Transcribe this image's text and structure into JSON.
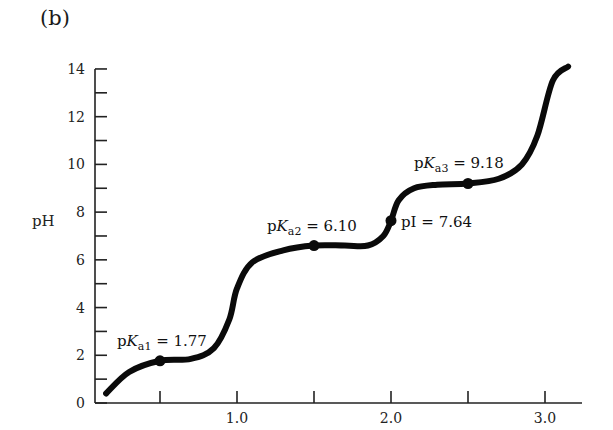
{
  "panel_label": "(b)",
  "chart_data": {
    "type": "line",
    "title": "",
    "xlabel": "",
    "ylabel": "pH",
    "xlim": [
      0.08,
      3.2
    ],
    "ylim": [
      0,
      14
    ],
    "x_ticks": [
      0.5,
      1.0,
      1.5,
      2.0,
      2.5,
      3.0
    ],
    "x_tick_labels": [
      "",
      "1.0",
      "",
      "2.0",
      "",
      "3.0"
    ],
    "y_ticks": [
      0,
      1,
      2,
      3,
      4,
      5,
      6,
      7,
      8,
      9,
      10,
      11,
      12,
      13,
      14
    ],
    "y_tick_labels": [
      "0",
      "",
      "2",
      "",
      "4",
      "",
      "6",
      "",
      "8",
      "",
      "10",
      "",
      "12",
      "",
      "14"
    ],
    "grid": false,
    "series": [
      {
        "name": "titration curve",
        "x": [
          0.15,
          0.3,
          0.5,
          0.7,
          0.85,
          0.95,
          1.0,
          1.1,
          1.3,
          1.5,
          1.7,
          1.85,
          1.95,
          2.0,
          2.05,
          2.15,
          2.3,
          2.5,
          2.7,
          2.85,
          2.95,
          3.05,
          3.15
        ],
        "y": [
          0.4,
          1.3,
          1.77,
          1.85,
          2.3,
          3.5,
          4.8,
          5.9,
          6.4,
          6.6,
          6.6,
          6.6,
          7.0,
          7.64,
          8.5,
          9.0,
          9.15,
          9.2,
          9.4,
          10.0,
          11.2,
          13.5,
          14.1
        ]
      }
    ],
    "annotations": [
      {
        "label": "pKa1 = 1.77",
        "prefix": "p",
        "K": "K",
        "sub": "a1",
        "value": "= 1.77",
        "x": 0.5,
        "y": 1.77
      },
      {
        "label": "pKa2 = 6.10",
        "prefix": "p",
        "K": "K",
        "sub": "a2",
        "value": "= 6.10",
        "x": 1.5,
        "y": 6.6
      },
      {
        "label": "pI = 7.64",
        "text": "pI = 7.64",
        "x": 2.0,
        "y": 7.64
      },
      {
        "label": "pKa3 = 9.18",
        "prefix": "p",
        "K": "K",
        "sub": "a3",
        "value": "= 9.18",
        "x": 2.5,
        "y": 9.2
      }
    ]
  }
}
